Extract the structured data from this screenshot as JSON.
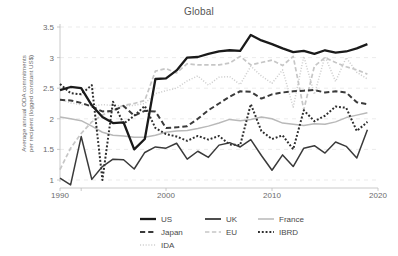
{
  "chart_data": {
    "type": "line",
    "title": "Global",
    "xlabel": "",
    "ylabel": "Average annual ODA commitments per recipient (logged constant US$)",
    "ylabel_line1": "Average annual ODA commitments",
    "ylabel_line2": "per recipient (logged constant US$)",
    "xlim": [
      1990,
      2020
    ],
    "ylim": [
      0.85,
      3.6
    ],
    "xticks": [
      1990,
      2000,
      2010,
      2020
    ],
    "xtick_labels": [
      "1990",
      "2000",
      "2010",
      "2020"
    ],
    "yticks": [
      1,
      1.5,
      2,
      2.5,
      3,
      3.5
    ],
    "ytick_labels": [
      "1",
      "1.5",
      "2",
      "2.5",
      "3",
      "3.5"
    ],
    "grid": "horizontal-dashed-faint",
    "legend_position": "bottom",
    "x": [
      1990,
      1991,
      1992,
      1993,
      1994,
      1995,
      1996,
      1997,
      1998,
      1999,
      2000,
      2001,
      2002,
      2003,
      2004,
      2005,
      2006,
      2007,
      2008,
      2009,
      2010,
      2011,
      2012,
      2013,
      2014,
      2015,
      2016,
      2017,
      2018,
      2019
    ],
    "series": [
      {
        "name": "US",
        "style": "solid",
        "color": "#1a1a1a",
        "width": 2.3,
        "values": [
          2.47,
          2.52,
          2.5,
          2.22,
          2.03,
          1.93,
          1.94,
          1.5,
          1.67,
          2.65,
          2.66,
          2.79,
          3.0,
          3.01,
          3.06,
          3.1,
          3.12,
          3.11,
          3.37,
          3.28,
          3.22,
          3.15,
          3.09,
          3.11,
          3.06,
          3.12,
          3.08,
          3.1,
          3.15,
          3.22
        ]
      },
      {
        "name": "UK",
        "style": "solid",
        "color": "#3a3a3a",
        "width": 1.5,
        "values": [
          1.03,
          0.92,
          1.71,
          1.01,
          1.22,
          1.34,
          1.33,
          1.18,
          1.45,
          1.54,
          1.52,
          1.6,
          1.34,
          1.47,
          1.37,
          1.57,
          1.61,
          1.54,
          1.66,
          1.4,
          1.16,
          1.41,
          1.22,
          1.52,
          1.56,
          1.44,
          1.62,
          1.55,
          1.36,
          1.82
        ]
      },
      {
        "name": "France",
        "style": "solid",
        "color": "#b9b9b9",
        "width": 1.5,
        "values": [
          2.03,
          2.0,
          1.97,
          1.88,
          1.78,
          1.73,
          1.72,
          1.7,
          1.7,
          1.73,
          1.78,
          1.8,
          1.81,
          1.84,
          1.88,
          1.93,
          1.99,
          1.97,
          1.99,
          2.03,
          2.0,
          1.93,
          1.91,
          1.89,
          1.92,
          1.91,
          1.95,
          2.02,
          2.06,
          2.1
        ]
      },
      {
        "name": "Japan",
        "style": "dashed",
        "color": "#3a3a3a",
        "width": 2.0,
        "values": [
          2.31,
          2.3,
          2.26,
          2.2,
          2.12,
          2.13,
          2.21,
          2.05,
          2.13,
          2.12,
          1.85,
          1.86,
          1.88,
          2.0,
          2.14,
          2.25,
          2.36,
          2.45,
          2.44,
          2.33,
          2.4,
          2.43,
          2.45,
          2.46,
          2.47,
          2.43,
          2.45,
          2.43,
          2.27,
          2.24
        ]
      },
      {
        "name": "EU",
        "style": "dashed",
        "color": "#c6c6c6",
        "width": 1.7,
        "values": [
          1.17,
          1.52,
          1.76,
          1.95,
          2.06,
          2.14,
          2.22,
          2.25,
          2.3,
          2.78,
          2.82,
          2.75,
          2.9,
          2.88,
          2.88,
          2.88,
          2.91,
          3.02,
          2.88,
          2.92,
          2.96,
          2.87,
          3.02,
          2.15,
          2.86,
          3.0,
          2.92,
          2.85,
          2.8,
          2.73
        ]
      },
      {
        "name": "IDA",
        "style": "dotted-fine",
        "color": "#cfcfcf",
        "width": 1.5,
        "values": [
          2.32,
          2.26,
          2.23,
          2.21,
          2.23,
          2.22,
          2.21,
          2.22,
          2.25,
          2.41,
          2.46,
          2.5,
          2.62,
          2.7,
          2.55,
          2.68,
          2.69,
          2.56,
          2.86,
          2.7,
          2.58,
          2.8,
          2.19,
          3.02,
          2.4,
          3.02,
          2.61,
          3.0,
          2.76,
          2.65
        ]
      },
      {
        "name": "IBRD",
        "style": "dotted",
        "color": "#2e2e2e",
        "width": 2.0,
        "values": [
          2.57,
          2.42,
          2.4,
          2.55,
          1.0,
          2.28,
          1.92,
          2.05,
          2.21,
          1.85,
          1.75,
          1.71,
          1.64,
          1.72,
          1.66,
          1.72,
          1.58,
          1.57,
          2.24,
          1.8,
          1.67,
          1.73,
          1.5,
          2.14,
          1.96,
          2.05,
          2.2,
          2.18,
          1.8,
          1.95
        ]
      }
    ]
  },
  "legend": {
    "entries": [
      {
        "label": "US",
        "style": "solid",
        "color": "#1a1a1a",
        "width": 2.3
      },
      {
        "label": "UK",
        "style": "solid",
        "color": "#3a3a3a",
        "width": 1.8
      },
      {
        "label": "France",
        "style": "solid",
        "color": "#b9b9b9",
        "width": 1.5
      },
      {
        "label": "Japan",
        "style": "dashed",
        "color": "#3a3a3a",
        "width": 2.0
      },
      {
        "label": "EU",
        "style": "dashed",
        "color": "#c6c6c6",
        "width": 1.7
      },
      {
        "label": "IBRD",
        "style": "dotted",
        "color": "#2e2e2e",
        "width": 2.0
      },
      {
        "label": "IDA",
        "style": "dotted-fine",
        "color": "#cfcfcf",
        "width": 1.5
      }
    ]
  }
}
